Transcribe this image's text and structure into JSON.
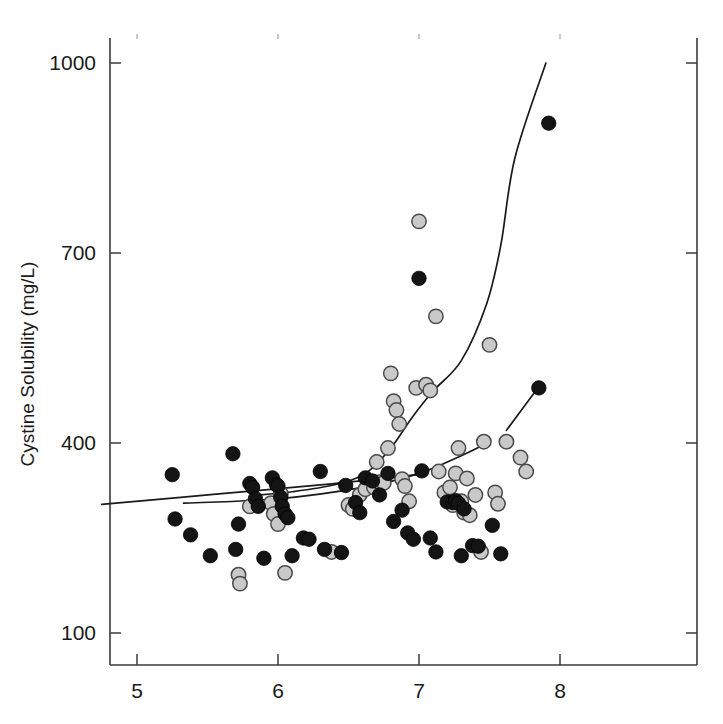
{
  "chart_data": {
    "type": "scatter",
    "title": "",
    "subtitle": "",
    "xlabel": "",
    "ylabel": "Cystine Solubility (mg/L)",
    "xlim": [
      4.7,
      8.7
    ],
    "ylim": [
      40,
      1090
    ],
    "xticks": [
      5,
      6,
      7,
      8
    ],
    "xticklabels": [
      "5",
      "6",
      "7",
      "8"
    ],
    "yticks": [
      100,
      400,
      700,
      1000
    ],
    "yticklabels": [
      "100",
      "400",
      "700",
      "1000"
    ],
    "grid": false,
    "legend": "none",
    "frame": "box",
    "tick_direction": "in",
    "colors": {
      "series_dark_fill": "#141414",
      "series_dark_edge": "#000000",
      "series_light_fill": "#c9c9c9",
      "series_light_edge": "#4a4a4a",
      "axis": "#3a3a3a",
      "trendline": "#1a1a1a",
      "background": "#ffffff"
    },
    "marker_radius": 7.2,
    "series": [
      {
        "name": "dark-filled-circles",
        "marker": "filled-circle",
        "points": [
          [
            5.25,
            350
          ],
          [
            5.27,
            280
          ],
          [
            5.38,
            255
          ],
          [
            5.52,
            222
          ],
          [
            5.68,
            383
          ],
          [
            5.7,
            232
          ],
          [
            5.72,
            272
          ],
          [
            5.8,
            336
          ],
          [
            5.82,
            330
          ],
          [
            5.84,
            312
          ],
          [
            5.86,
            300
          ],
          [
            5.9,
            218
          ],
          [
            5.96,
            345
          ],
          [
            5.99,
            334
          ],
          [
            6.0,
            332
          ],
          [
            6.02,
            314
          ],
          [
            6.03,
            300
          ],
          [
            6.05,
            288
          ],
          [
            6.07,
            282
          ],
          [
            6.1,
            222
          ],
          [
            6.18,
            250
          ],
          [
            6.22,
            248
          ],
          [
            6.3,
            355
          ],
          [
            6.33,
            232
          ],
          [
            6.45,
            227
          ],
          [
            6.48,
            333
          ],
          [
            6.55,
            306
          ],
          [
            6.58,
            290
          ],
          [
            6.62,
            345
          ],
          [
            6.67,
            340
          ],
          [
            6.72,
            318
          ],
          [
            6.78,
            352
          ],
          [
            6.82,
            276
          ],
          [
            6.88,
            294
          ],
          [
            6.92,
            258
          ],
          [
            6.96,
            248
          ],
          [
            7.0,
            660
          ],
          [
            7.02,
            356
          ],
          [
            7.08,
            250
          ],
          [
            7.12,
            228
          ],
          [
            7.2,
            307
          ],
          [
            7.24,
            306
          ],
          [
            7.26,
            309
          ],
          [
            7.28,
            305
          ],
          [
            7.3,
            222
          ],
          [
            7.32,
            296
          ],
          [
            7.38,
            238
          ],
          [
            7.42,
            237
          ],
          [
            7.52,
            270
          ],
          [
            7.58,
            225
          ],
          [
            7.92,
            905
          ],
          [
            7.85,
            487
          ]
        ]
      },
      {
        "name": "light-gray-circles",
        "marker": "open-circle-gray",
        "points": [
          [
            5.72,
            192
          ],
          [
            5.73,
            178
          ],
          [
            5.8,
            300
          ],
          [
            5.95,
            305
          ],
          [
            5.97,
            288
          ],
          [
            6.0,
            272
          ],
          [
            6.02,
            320
          ],
          [
            6.05,
            195
          ],
          [
            6.38,
            228
          ],
          [
            6.5,
            302
          ],
          [
            6.53,
            296
          ],
          [
            6.58,
            318
          ],
          [
            6.62,
            327
          ],
          [
            6.68,
            330
          ],
          [
            6.7,
            370
          ],
          [
            6.72,
            338
          ],
          [
            6.75,
            337
          ],
          [
            6.78,
            392
          ],
          [
            6.8,
            510
          ],
          [
            6.82,
            466
          ],
          [
            6.84,
            452
          ],
          [
            6.86,
            430
          ],
          [
            6.88,
            343
          ],
          [
            6.9,
            332
          ],
          [
            6.93,
            308
          ],
          [
            6.98,
            487
          ],
          [
            7.0,
            750
          ],
          [
            7.05,
            492
          ],
          [
            7.08,
            483
          ],
          [
            7.12,
            600
          ],
          [
            7.14,
            355
          ],
          [
            7.18,
            322
          ],
          [
            7.22,
            330
          ],
          [
            7.24,
            302
          ],
          [
            7.26,
            352
          ],
          [
            7.28,
            392
          ],
          [
            7.3,
            308
          ],
          [
            7.32,
            290
          ],
          [
            7.34,
            344
          ],
          [
            7.36,
            286
          ],
          [
            7.4,
            318
          ],
          [
            7.44,
            228
          ],
          [
            7.46,
            402
          ],
          [
            7.5,
            555
          ],
          [
            7.54,
            322
          ],
          [
            7.56,
            304
          ],
          [
            7.62,
            402
          ],
          [
            7.72,
            377
          ],
          [
            7.76,
            355
          ]
        ]
      }
    ],
    "trendlines": [
      {
        "name": "upper-steep-curve",
        "description": "steeply rising curve through gray series",
        "points": [
          [
            5.82,
            317
          ],
          [
            6.1,
            323
          ],
          [
            6.4,
            334
          ],
          [
            6.62,
            352
          ],
          [
            6.8,
            392
          ],
          [
            6.95,
            440
          ],
          [
            7.1,
            482
          ],
          [
            7.3,
            530
          ],
          [
            7.48,
            620
          ],
          [
            7.58,
            712
          ],
          [
            7.68,
            850
          ],
          [
            7.9,
            1000
          ]
        ]
      },
      {
        "name": "lower-flat-line-dark",
        "description": "nearly flat line across dark series",
        "points": [
          [
            4.75,
            303
          ],
          [
            5.6,
            320
          ],
          [
            6.4,
            336
          ],
          [
            7.0,
            350
          ]
        ]
      },
      {
        "name": "mid-flat-curve-gray",
        "description": "flat curve rising slightly at right",
        "points": [
          [
            5.33,
            305
          ],
          [
            6.0,
            312
          ],
          [
            6.6,
            330
          ],
          [
            7.0,
            352
          ],
          [
            7.3,
            380
          ],
          [
            7.44,
            395
          ]
        ]
      },
      {
        "name": "short-segment-upper-right",
        "description": "short rising segment near top right",
        "points": [
          [
            7.62,
            420
          ],
          [
            7.86,
            492
          ]
        ]
      }
    ]
  },
  "axes": {
    "y_title": "Cystine Solubility (mg/L)",
    "x_title": ""
  }
}
